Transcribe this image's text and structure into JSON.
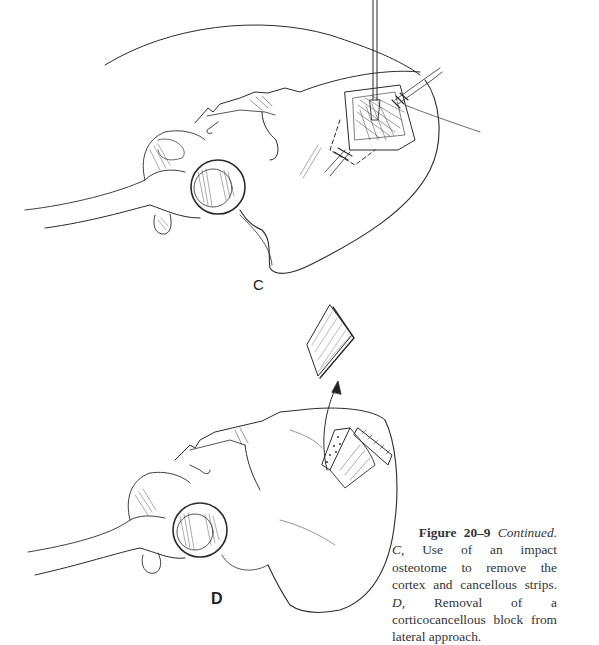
{
  "figure": {
    "panels": [
      {
        "label": "C",
        "description": "Use of an impact osteotome to remove the cortex and cancellous strips"
      },
      {
        "label": "D",
        "description": "Removal of a corticocancellous block from lateral approach"
      }
    ],
    "caption": {
      "figure_number": "Figure 20–9",
      "continued": "Continued.",
      "panel_c_letter": "C,",
      "panel_c_text": "Use of an impact osteotome to remove the cortex and cancellous strips.",
      "panel_d_letter": "D,",
      "panel_d_text": "Removal of a corticocancellous block from lateral approach."
    }
  }
}
